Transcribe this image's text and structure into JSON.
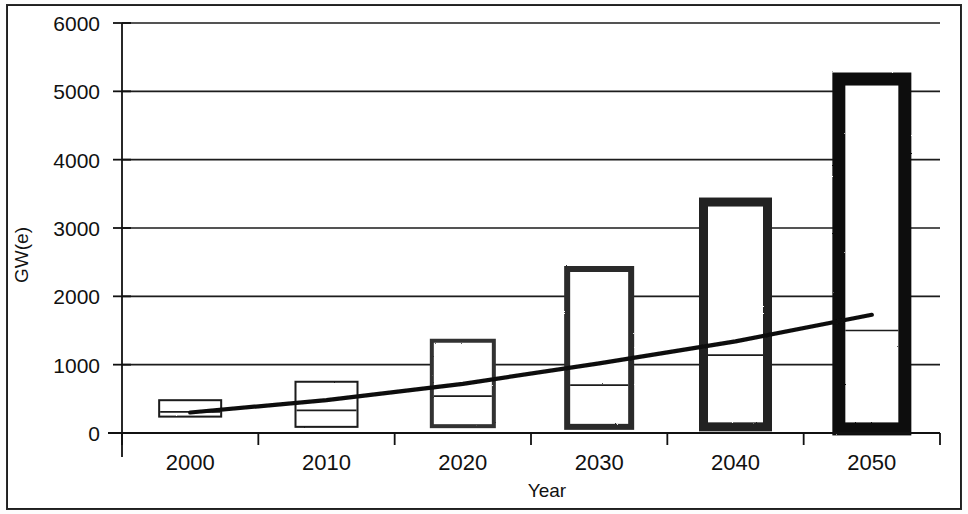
{
  "chart_data": {
    "type": "bar",
    "subtype": "floating-range-bar-with-trend-line",
    "title": "",
    "xlabel": "Year",
    "ylabel": "GW(e)",
    "categories": [
      "2000",
      "2010",
      "2020",
      "2030",
      "2040",
      "2050"
    ],
    "x": [
      2000,
      2010,
      2020,
      2030,
      2040,
      2050
    ],
    "xlim": [
      1995,
      2055
    ],
    "ylim": [
      0,
      6000
    ],
    "y_ticks": [
      0,
      1000,
      2000,
      3000,
      4000,
      5000,
      6000
    ],
    "y_tick_labels": [
      "0",
      "1000",
      "2000",
      "3000",
      "4000",
      "5000",
      "6000"
    ],
    "x_tick_labels": [
      "2000",
      "2010",
      "2020",
      "2030",
      "2040",
      "2050"
    ],
    "grid": true,
    "grid_axis": "y",
    "legend": "none",
    "series": [
      {
        "name": "Range (low-high)",
        "type": "range-bar",
        "low": [
          240,
          90,
          100,
          90,
          90,
          60
        ],
        "high": [
          480,
          750,
          1350,
          2400,
          3380,
          5180
        ],
        "mid": [
          310,
          330,
          540,
          700,
          1140,
          1500
        ]
      },
      {
        "name": "Trend",
        "type": "line",
        "values": [
          300,
          480,
          720,
          1020,
          1340,
          1730
        ]
      }
    ],
    "bar_style": {
      "fill": "#ffffff",
      "edge_colors": [
        "#1a1a1a",
        "#1a1a1a",
        "#333333",
        "#2b2b2b",
        "#222222",
        "#0d0d0d"
      ],
      "edge_widths": [
        2,
        2,
        4,
        6,
        9,
        13
      ],
      "bar_widths_px": [
        62,
        62,
        62,
        64,
        64,
        66
      ]
    },
    "line_color": "#0d0d0d",
    "axis_color": "#111111",
    "grid_color": "#1a1a1a",
    "background": "#ffffff"
  },
  "axes": {
    "y_title": "GW(e)",
    "x_title": "Year"
  }
}
